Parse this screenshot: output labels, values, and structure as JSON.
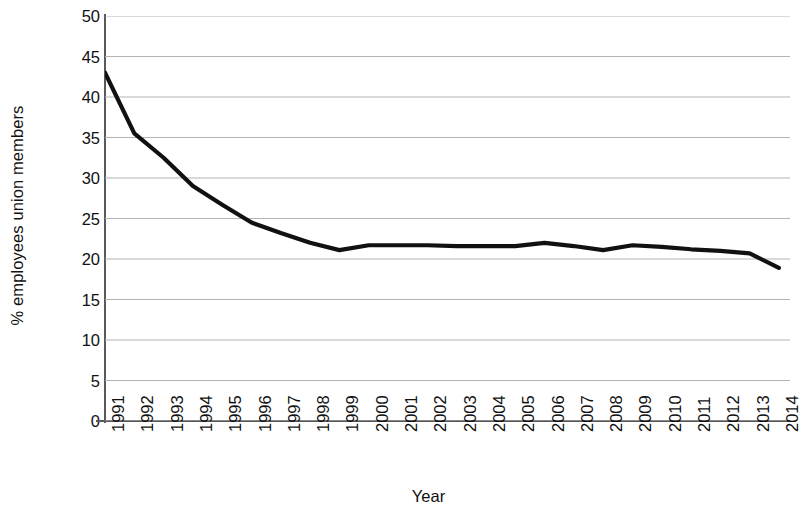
{
  "chart_data": {
    "type": "line",
    "title": "",
    "xlabel": "Year",
    "ylabel": "% employees union members",
    "x": [
      1991,
      1992,
      1993,
      1994,
      1995,
      1996,
      1997,
      1998,
      1999,
      2000,
      2001,
      2002,
      2003,
      2004,
      2005,
      2006,
      2007,
      2008,
      2009,
      2010,
      2011,
      2012,
      2013,
      2014
    ],
    "categories": [
      "1991",
      "1992",
      "1993",
      "1994",
      "1995",
      "1996",
      "1997",
      "1998",
      "1999",
      "2000",
      "2001",
      "2002",
      "2003",
      "2004",
      "2005",
      "2006",
      "2007",
      "2008",
      "2009",
      "2010",
      "2011",
      "2012",
      "2013",
      "2014"
    ],
    "values": [
      43.0,
      35.5,
      32.5,
      29.0,
      26.7,
      24.5,
      23.2,
      22.0,
      21.1,
      21.7,
      21.7,
      21.7,
      21.6,
      21.6,
      21.6,
      22.0,
      21.6,
      21.1,
      21.7,
      21.5,
      21.2,
      21.0,
      20.7,
      18.9
    ],
    "ylim": [
      0,
      50
    ],
    "ytick_step": 5,
    "yticks": [
      "50",
      "45",
      "40",
      "35",
      "30",
      "25",
      "20",
      "15",
      "10",
      "5",
      "0"
    ],
    "ytick_values": [
      50,
      45,
      40,
      35,
      30,
      25,
      20,
      15,
      10,
      5,
      0
    ],
    "grid": "horizontal",
    "legend": "none",
    "line_color": "#111111",
    "grid_color": "#b4b4b4",
    "axis_color": "#58595b",
    "line_width": 4.2
  }
}
